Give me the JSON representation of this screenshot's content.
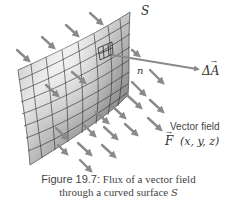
{
  "figure": {
    "surface_label": "S",
    "normal_label": "n",
    "area_vector_label": "ΔA",
    "area_vector_arrow": "→",
    "field_title": "Vector field",
    "field_symbol": "F",
    "field_args": "(x, y, z)",
    "field_arrow": "→"
  },
  "caption": {
    "number": "Figure 19.7:",
    "line1_text": " Flux of a vector field",
    "line2_text": "through a curved surface ",
    "line2_math": "S"
  },
  "colors": {
    "arrow": "#8a8a8a",
    "surface_light": "#e4e4e4",
    "surface_dark": "#6a6a6a",
    "grid": "#2a2a2a",
    "text": "#444444"
  }
}
